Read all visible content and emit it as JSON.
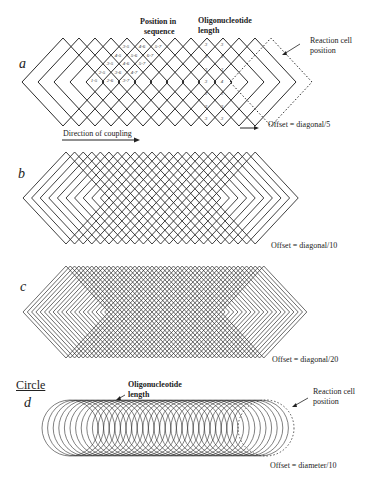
{
  "figure": {
    "panels": [
      {
        "id": "a",
        "letter": "a",
        "shape": "diamond",
        "offset_label": "Offset = diagonal/5",
        "top_labels": {
          "position_in_sequence": [
            "Position in",
            "sequence"
          ],
          "oligonucleotide_length": [
            "Oligonucleotide",
            "length"
          ]
        },
        "reaction_cell_label": [
          "Reaction cell",
          "position"
        ],
        "direction_label": "Direction of coupling",
        "cell_labels": [
          [
            "3-5",
            "4-6",
            "5-7"
          ],
          [
            "4-5",
            "5-6",
            "6-7"
          ],
          [
            "3-5",
            "4-6",
            "5-7"
          ],
          [
            "2-5",
            "3-6",
            "4-7"
          ],
          [
            "1-5",
            "2-6",
            "3-7"
          ]
        ],
        "length_column_1": [
          "3",
          "3",
          "3",
          "3",
          "3",
          "3",
          "3"
        ],
        "length_column_2": [
          "3",
          "3",
          "3",
          "4",
          "3",
          "3",
          "3"
        ]
      },
      {
        "id": "b",
        "letter": "b",
        "shape": "diamond",
        "offset_label": "Offset = diagonal/10"
      },
      {
        "id": "c",
        "letter": "c",
        "shape": "diamond",
        "offset_label": "Offset = diagonal/20"
      },
      {
        "id": "d",
        "letter": "d",
        "title": "Circle",
        "shape": "circle",
        "offset_label": "Offset = diameter/10",
        "length_label": [
          "Oligonucleotide",
          "length"
        ],
        "reaction_cell_label": [
          "Reaction cell",
          "position"
        ]
      }
    ],
    "geometry": {
      "a": {
        "cy": 82,
        "halfW": 41,
        "halfH": 44,
        "firstCx": 63,
        "step": 16,
        "count": 13,
        "dashed": true
      },
      "b": {
        "cy": 198,
        "halfW": 43,
        "halfH": 46,
        "firstCx": 66,
        "step": 8.6,
        "count": 23,
        "dashed": false
      },
      "c": {
        "cy": 312,
        "halfW": 43,
        "halfH": 46,
        "firstCx": 66,
        "step": 4.3,
        "count": 47,
        "dashed": false
      },
      "d": {
        "cy": 428,
        "r": 28,
        "firstCx": 70,
        "step": 5.6,
        "count": 35,
        "dashed": true
      }
    },
    "colors": {
      "line": "#2a2a2a",
      "background": "#ffffff"
    }
  }
}
